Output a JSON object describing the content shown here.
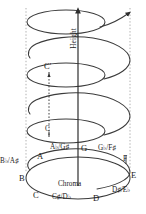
{
  "figure": {
    "type": "pitch-helix-diagram",
    "axis_labels": {
      "vertical": "Height",
      "circular": "Chroma"
    },
    "octave_markers": {
      "lower": "C",
      "upper": "C'"
    },
    "colors": {
      "stroke": "#3b3b3b",
      "guide": "#9a9a9a",
      "text": "#1a1a1a",
      "background": "#ffffff"
    },
    "pitch_classes": [
      {
        "id": "a",
        "label": "A",
        "sharp": "",
        "flat": ""
      },
      {
        "id": "ab-gs",
        "label": "A",
        "flat": "♭",
        "alt": "G",
        "sharp": "♯"
      },
      {
        "id": "g",
        "label": "G",
        "sharp": "",
        "flat": ""
      },
      {
        "id": "gb-fs",
        "label": "G",
        "flat": "♭",
        "alt": "F",
        "sharp": "♯"
      },
      {
        "id": "f",
        "label": "F",
        "sharp": "",
        "flat": ""
      },
      {
        "id": "e",
        "label": "E",
        "sharp": "",
        "flat": ""
      },
      {
        "id": "ds-eb",
        "label": "D",
        "sharp": "♯",
        "alt": "E",
        "flat": "♭"
      },
      {
        "id": "d",
        "label": "D",
        "sharp": "",
        "flat": ""
      },
      {
        "id": "cs-db",
        "label": "C",
        "sharp": "♯",
        "alt": "D",
        "flat": "♭"
      },
      {
        "id": "c",
        "label": "C",
        "sharp": "",
        "flat": ""
      },
      {
        "id": "b",
        "label": "B",
        "sharp": "",
        "flat": ""
      },
      {
        "id": "bb-as",
        "label": "B",
        "flat": "♭",
        "alt": "A",
        "sharp": "♯"
      }
    ],
    "note_text": {
      "a": "A",
      "ab_gs": "A♭/G♯",
      "g": "G",
      "gb_fs": "G♭/F♯",
      "f": "F",
      "e": "E",
      "ds_eb": "D♯/E♭",
      "d": "D",
      "cs_db": "C♯/D♭",
      "c": "C",
      "b": "B",
      "bb_as": "B♭/A♯"
    }
  }
}
